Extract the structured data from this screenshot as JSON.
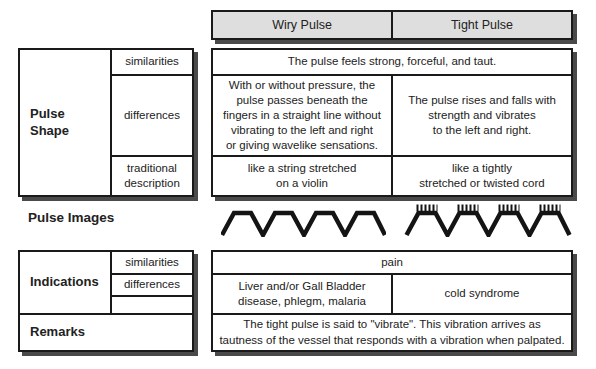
{
  "palette": {
    "background": "#ffffff",
    "border": "#1a1a1a",
    "shadow": "#4a4a4a",
    "header_fill": "#dedede",
    "text": "#222222"
  },
  "header": {
    "wiry_label": "Wiry Pulse",
    "tight_label": "Tight Pulse"
  },
  "pulse_shape": {
    "row_label": "Pulse\nShape",
    "sub_labels": {
      "similarities": "similarities",
      "differences": "differences",
      "traditional": "traditional\ndescription"
    },
    "similarities_text": "The pulse feels strong, forceful, and taut.",
    "differences_wiry": "With or without pressure, the\npulse passes beneath the\nfingers in a straight line without\nvibrating to the left and right\nor giving wavelike sensations.",
    "differences_tight": "The pulse rises and falls with\nstrength and vibrates\nto the left and right.",
    "traditional_wiry": "like a string stretched\non a violin",
    "traditional_tight": "like a tightly\nstretched or twisted cord"
  },
  "pulse_images": {
    "label": "Pulse Images",
    "icons": [
      "wiry-pulse-waveform-icon",
      "tight-pulse-waveform-icon"
    ]
  },
  "indications": {
    "row_label": "Indications",
    "sub_labels": {
      "similarities": "similarities",
      "differences": "differences"
    },
    "similarities_text": "pain",
    "differences_wiry": "Liver and/or Gall Bladder\ndisease, phlegm, malaria",
    "differences_tight": "cold syndrome"
  },
  "remarks": {
    "row_label": "Remarks",
    "text": "The tight pulse is said to \"vibrate\". This vibration arrives as\ntautness of the vessel that responds with a vibration when palpated."
  }
}
